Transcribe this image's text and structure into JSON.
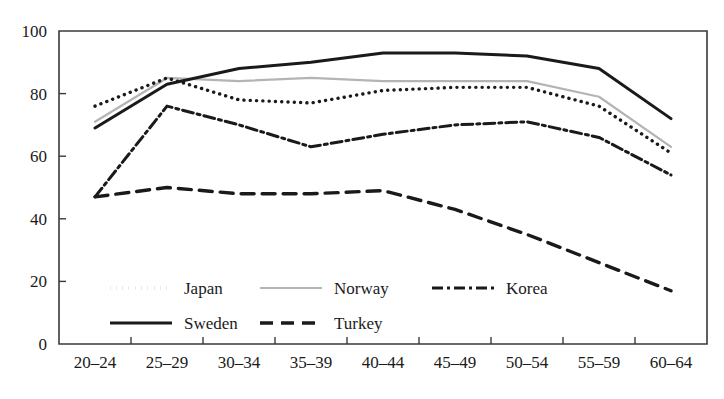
{
  "chart_data": {
    "type": "line",
    "title": "",
    "subtitle": "",
    "xlabel": "",
    "ylabel": "",
    "categories": [
      "20–24",
      "25–29",
      "30–34",
      "35–39",
      "40–44",
      "45–49",
      "50–54",
      "55–59",
      "60–64"
    ],
    "ylim": [
      0,
      100
    ],
    "yticks": [
      0,
      20,
      40,
      60,
      80,
      100
    ],
    "grid": false,
    "legend_position": "inside-bottom-left",
    "series": [
      {
        "name": "Japan",
        "style": "dotted",
        "color": "#1a1a1a",
        "values": [
          76,
          85,
          78,
          77,
          81,
          82,
          82,
          76,
          61
        ]
      },
      {
        "name": "Norway",
        "style": "solid-light",
        "color": "#b4b4b4",
        "values": [
          71,
          85,
          84,
          85,
          84,
          84,
          84,
          79,
          63
        ]
      },
      {
        "name": "Korea",
        "style": "dash-dot",
        "color": "#1a1a1a",
        "values": [
          47,
          76,
          70,
          63,
          67,
          70,
          71,
          66,
          54
        ]
      },
      {
        "name": "Sweden",
        "style": "solid",
        "color": "#1a1a1a",
        "values": [
          69,
          83,
          88,
          90,
          93,
          93,
          92,
          88,
          72
        ]
      },
      {
        "name": "Turkey",
        "style": "dashed",
        "color": "#1a1a1a",
        "values": [
          47,
          50,
          48,
          48,
          49,
          43,
          35,
          26,
          17
        ]
      }
    ]
  },
  "axes": {
    "y_tick_labels": [
      "0",
      "20",
      "40",
      "60",
      "80",
      "100"
    ],
    "x_tick_labels": [
      "20–24",
      "25–29",
      "30–34",
      "35–39",
      "40–44",
      "45–49",
      "50–54",
      "55–59",
      "60–64"
    ]
  },
  "legend": {
    "entries": [
      {
        "label": "Japan",
        "style": "dotted"
      },
      {
        "label": "Norway",
        "style": "solid-light"
      },
      {
        "label": "Korea",
        "style": "dash-dot"
      },
      {
        "label": "Sweden",
        "style": "solid"
      },
      {
        "label": "Turkey",
        "style": "dashed"
      }
    ]
  }
}
